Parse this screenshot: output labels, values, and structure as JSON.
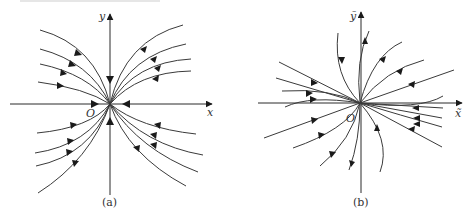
{
  "figure": {
    "panels": [
      {
        "id": "a",
        "caption": "(a)",
        "x_label": "x",
        "y_label": "y",
        "origin_label": "O",
        "origin": [
          110,
          104
        ],
        "description": "Phase portrait: all trajectories flow into origin (stable node); trajectories tangent to y-axis near origin"
      },
      {
        "id": "b",
        "caption": "(b)",
        "x_label": "x̃",
        "y_label": "ỹ",
        "origin_label": "O",
        "origin": [
          360,
          103
        ],
        "description": "Phase portrait in transformed coordinates: trajectories flow into origin (stable node)"
      }
    ],
    "colors": {
      "line": "#3a3a3a",
      "arrow": "#1a1a1a",
      "background": "#ffffff"
    }
  }
}
